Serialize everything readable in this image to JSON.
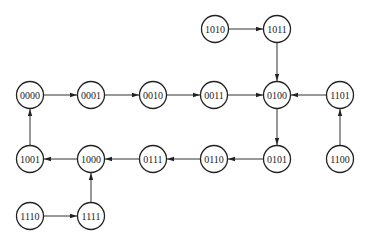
{
  "diagram": {
    "type": "state-transition-diagram",
    "node_radius": 13.5,
    "colors": {
      "stroke": "#222222",
      "fill": "#ffffff",
      "text": "#222222"
    },
    "nodes": [
      {
        "id": "1010",
        "label": "1010",
        "x": 215,
        "y": 29
      },
      {
        "id": "1011",
        "label": "1011",
        "x": 277,
        "y": 29
      },
      {
        "id": "0000",
        "label": "0000",
        "x": 30,
        "y": 95
      },
      {
        "id": "0001",
        "label": "0001",
        "x": 91,
        "y": 95
      },
      {
        "id": "0010",
        "label": "0010",
        "x": 153,
        "y": 95
      },
      {
        "id": "0011",
        "label": "0011",
        "x": 214,
        "y": 95
      },
      {
        "id": "0100",
        "label": "0100",
        "x": 277,
        "y": 95
      },
      {
        "id": "1101",
        "label": "1101",
        "x": 340,
        "y": 95
      },
      {
        "id": "1001",
        "label": "1001",
        "x": 30,
        "y": 159
      },
      {
        "id": "1000",
        "label": "1000",
        "x": 91,
        "y": 159
      },
      {
        "id": "0111",
        "label": "0111",
        "x": 153,
        "y": 159
      },
      {
        "id": "0110",
        "label": "0110",
        "x": 214,
        "y": 159
      },
      {
        "id": "0101",
        "label": "0101",
        "x": 277,
        "y": 159
      },
      {
        "id": "1100",
        "label": "1100",
        "x": 340,
        "y": 159
      },
      {
        "id": "1110",
        "label": "1110",
        "x": 30,
        "y": 216
      },
      {
        "id": "1111",
        "label": "1111",
        "x": 91,
        "y": 216
      }
    ],
    "edges": [
      {
        "from": "0000",
        "to": "0001"
      },
      {
        "from": "0001",
        "to": "0010"
      },
      {
        "from": "0010",
        "to": "0011"
      },
      {
        "from": "0011",
        "to": "0100"
      },
      {
        "from": "0100",
        "to": "0101"
      },
      {
        "from": "0101",
        "to": "0110"
      },
      {
        "from": "0110",
        "to": "0111"
      },
      {
        "from": "0111",
        "to": "1000"
      },
      {
        "from": "1000",
        "to": "1001"
      },
      {
        "from": "1001",
        "to": "0000"
      },
      {
        "from": "1010",
        "to": "1011"
      },
      {
        "from": "1011",
        "to": "0100"
      },
      {
        "from": "1100",
        "to": "1101"
      },
      {
        "from": "1101",
        "to": "0100"
      },
      {
        "from": "1110",
        "to": "1111"
      },
      {
        "from": "1111",
        "to": "1000"
      }
    ]
  }
}
